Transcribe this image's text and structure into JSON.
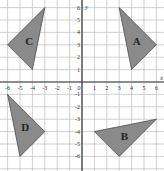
{
  "diagram": {
    "type": "coordinate-grid",
    "x_axis_label": "x",
    "y_axis_label": "y",
    "x_range": [
      -6,
      6
    ],
    "y_range": [
      -6,
      6
    ],
    "x_ticks": [
      "-6",
      "-5",
      "-4",
      "-3",
      "-2",
      "-1",
      "0",
      "1",
      "2",
      "3",
      "4",
      "5",
      "6"
    ],
    "y_ticks": [
      "6",
      "5",
      "4",
      "3",
      "2",
      "1",
      "-1",
      "-2",
      "-3",
      "-4",
      "-5",
      "-6"
    ],
    "shape_fill": "#8a8a8a",
    "shape_stroke": "#4a4a4a",
    "shapes": [
      {
        "label": "A",
        "vertices": [
          [
            3,
            6
          ],
          [
            6,
            3
          ],
          [
            4,
            1
          ]
        ]
      },
      {
        "label": "B",
        "vertices": [
          [
            1,
            -4
          ],
          [
            6,
            -3
          ],
          [
            3,
            -6
          ]
        ]
      },
      {
        "label": "C",
        "vertices": [
          [
            -3,
            6
          ],
          [
            -6,
            3
          ],
          [
            -4,
            1
          ]
        ]
      },
      {
        "label": "D",
        "vertices": [
          [
            -6,
            -1
          ],
          [
            -3,
            -4
          ],
          [
            -5,
            -6
          ]
        ]
      }
    ]
  }
}
